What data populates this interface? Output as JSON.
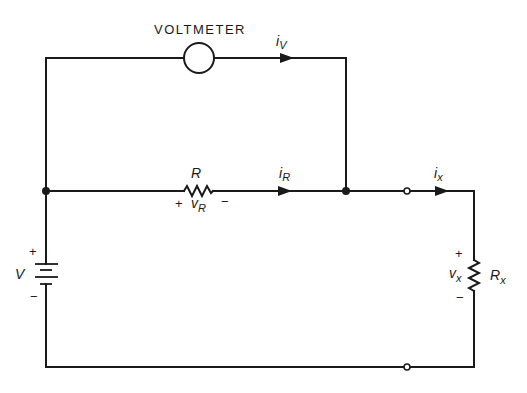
{
  "diagram": {
    "type": "circuit-schematic",
    "colors": {
      "ink": "#1a1a1a",
      "background": "#ffffff"
    },
    "components": {
      "voltmeter": {
        "label": "VOLTMETER"
      },
      "resistor_r": {
        "label": "R",
        "voltage_main": "v",
        "voltage_sub": "R",
        "plus": "+",
        "minus": "−"
      },
      "battery": {
        "label": "V",
        "plus": "+",
        "minus": "−"
      },
      "resistor_x": {
        "label_main": "R",
        "label_sub": "x",
        "voltage_main": "v",
        "voltage_sub": "x",
        "plus": "+",
        "minus": "−"
      }
    },
    "currents": {
      "i_v": {
        "main": "i",
        "sub": "V"
      },
      "i_r": {
        "main": "i",
        "sub": "R"
      },
      "i_x": {
        "main": "i",
        "sub": "x"
      }
    }
  }
}
